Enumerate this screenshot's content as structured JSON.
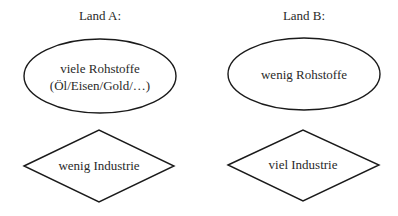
{
  "diagram": {
    "columns": [
      {
        "title": "Land A:",
        "resources": {
          "line1": "viele Rohstoffe",
          "line2": "(Öl/Eisen/Gold/…)"
        },
        "industry": "wenig Industrie"
      },
      {
        "title": "Land B:",
        "resources": {
          "line1": "wenig Rohstoffe"
        },
        "industry": "viel Industrie"
      }
    ],
    "colors": {
      "stroke": "#1a1a1a",
      "text": "#2a2a2a",
      "background": "#ffffff"
    }
  }
}
